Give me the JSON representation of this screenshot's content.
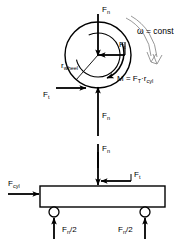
{
  "diagram": {
    "stroke_color": "#000000",
    "background_color": "#ffffff",
    "width": 187,
    "height": 244
  },
  "labels": {
    "force_normal_top": {
      "symbol": "F",
      "sub": "n"
    },
    "force_tangential_wheel": {
      "symbol": "F",
      "sub": "t"
    },
    "radius_wheel": {
      "symbol": "r",
      "sub": "wheel"
    },
    "omega_const": "ω = const",
    "moment_eq": {
      "m": "M",
      "eq": "=",
      "f": "F",
      "fsub": "T",
      "dot": "·",
      "r": "r",
      "rsub": "cyl"
    },
    "force_tangential_contact": {
      "symbol": "F",
      "sub": "t"
    },
    "force_normal_up": {
      "symbol": "F",
      "sub": "n"
    },
    "force_normal_down": {
      "symbol": "F",
      "sub": "n"
    },
    "force_normal_beam": {
      "symbol": "F",
      "sub": "n"
    },
    "force_tangential_beam": {
      "symbol": "F",
      "sub": "t"
    },
    "force_cylinder": {
      "symbol": "F",
      "sub": "cyl"
    },
    "reaction_left": {
      "symbol": "F",
      "sub": "n",
      "suffix": "/2"
    },
    "reaction_right": {
      "symbol": "F",
      "sub": "n",
      "suffix": "/2"
    }
  },
  "elements": {
    "wheel_outer_circle": "wheel-outer",
    "wheel_inner_circle": "wheel-inner",
    "beam": "support-beam",
    "support_left": "pin-support-left",
    "support_right": "pin-support-right",
    "rotation_arrow": "omega-curved-arrow",
    "moment_arrow": "moment-curved-arrow"
  }
}
